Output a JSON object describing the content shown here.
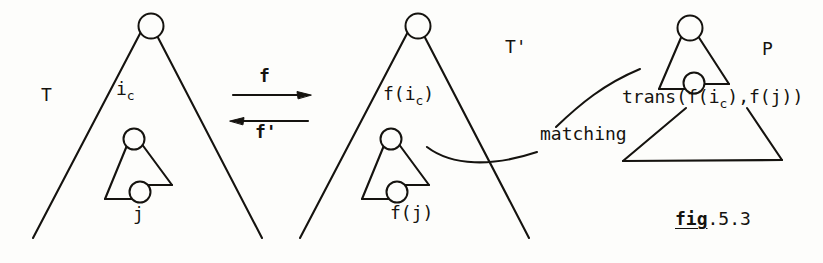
{
  "figure": {
    "caption_word": "fig",
    "caption_rest": ".5.3",
    "structures": {
      "source_tree_label": "T",
      "target_tree_label": "T'",
      "pattern_label": "P"
    },
    "arrows": {
      "forward_label": "f",
      "backward_label": "f'"
    },
    "nodes": {
      "source_root_marker": "1",
      "source_inner_top": "i",
      "source_inner_top_sub": "c",
      "source_inner_bottom": "j",
      "target_root_marker": "1",
      "target_inner_top": "f(i",
      "target_inner_top_sub": "c",
      "target_inner_top_close": ")",
      "target_inner_bottom": "f(j)",
      "pattern_root_marker": "1",
      "pattern_inner_prefix": "trans(f(i",
      "pattern_inner_sub": "c",
      "pattern_inner_suffix": "),f(j))"
    },
    "relations": {
      "matching_label": "matching"
    },
    "colors": {
      "ink": "#15130f",
      "paper": "#fdfdfb"
    }
  }
}
